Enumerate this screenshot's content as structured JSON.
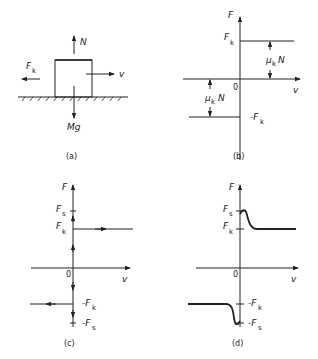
{
  "figure": {
    "panels": [
      {
        "id": "a",
        "caption": "(a)",
        "type": "free-body diagram",
        "labels": {
          "normal": "N",
          "friction": "F",
          "friction_sub": "k",
          "velocity": "v",
          "weight": "Mg"
        }
      },
      {
        "id": "b",
        "caption": "(b)",
        "type": "friction vs velocity (ideal Coulomb)",
        "labels": {
          "y_axis": "F",
          "x_axis": "v",
          "origin": "0",
          "fk": "F",
          "fk_sub": "k",
          "neg_fk": "-F",
          "neg_fk_sub": "k",
          "mu_upper": "μ",
          "mu_upper_sub": "k",
          "mu_upper_n": "N",
          "mu_lower": "μ",
          "mu_lower_sub": "k",
          "mu_lower_n": "N"
        }
      },
      {
        "id": "c",
        "caption": "(c)",
        "type": "friction vs velocity (static + kinetic)",
        "labels": {
          "y_axis": "F",
          "x_axis": "v",
          "origin": "0",
          "fs": "F",
          "fs_sub": "s",
          "fk": "F",
          "fk_sub": "k",
          "neg_fk": "-F",
          "neg_fk_sub": "k",
          "neg_fs": "-F",
          "neg_fs_sub": "s"
        }
      },
      {
        "id": "d",
        "caption": "(d)",
        "type": "friction vs velocity (smooth Stribeck)",
        "labels": {
          "y_axis": "F",
          "x_axis": "v",
          "origin": "0",
          "fs": "F",
          "fs_sub": "s",
          "fk": "F",
          "fk_sub": "k",
          "neg_fk": "-F",
          "neg_fk_sub": "k",
          "neg_fs": "-F",
          "neg_fs_sub": "s"
        }
      }
    ]
  }
}
